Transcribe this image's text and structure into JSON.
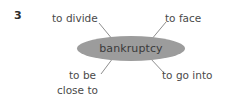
{
  "diagram": {
    "type": "word-web",
    "item_number": "3",
    "center": {
      "label": "bankruptcy",
      "fill_color": "#9c9c9c",
      "text_color": "#3a3a3a"
    },
    "collocates": [
      {
        "id": "to-divide",
        "label": "to divide",
        "position": "top-left"
      },
      {
        "id": "to-face",
        "label": "to face",
        "position": "top-right"
      },
      {
        "id": "to-be-close-to",
        "label": "to be",
        "label_line2": "close to",
        "position": "bottom-left"
      },
      {
        "id": "to-go-into",
        "label": "to go into",
        "position": "bottom-right"
      }
    ],
    "connectors": [
      {
        "from": "to-divide",
        "x1": 99,
        "y1": 23,
        "x2": 113,
        "y2": 40
      },
      {
        "from": "to-face",
        "x1": 166,
        "y1": 22,
        "x2": 151,
        "y2": 40
      },
      {
        "from": "to-be",
        "x1": 113,
        "y1": 58,
        "x2": 101,
        "y2": 74
      },
      {
        "from": "to-go-into",
        "x1": 150,
        "y1": 58,
        "x2": 164,
        "y2": 73
      }
    ],
    "line_color": "#8e8e8e"
  }
}
